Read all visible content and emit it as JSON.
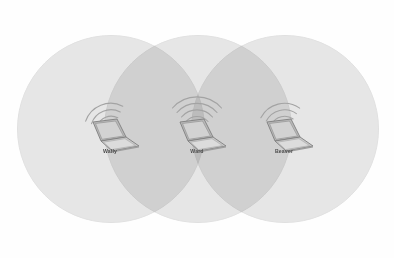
{
  "diagram": {
    "background_color": "#fefefe",
    "circle_fill": "#d9d9d9",
    "circle_stroke": "#cfcfcf",
    "circle_opacity": 0.62,
    "circle_diameter": 186,
    "label_color": "#4b4b4b",
    "laptop_color": "#8f8f8f",
    "arc_color": "#a8a8a8",
    "circles": [
      {
        "name": "left-coverage-area",
        "cx": 110,
        "cy": 128,
        "r": 93
      },
      {
        "name": "center-coverage-area",
        "cx": 197,
        "cy": 128,
        "r": 93
      },
      {
        "name": "right-coverage-area",
        "cx": 284,
        "cy": 128,
        "r": 93
      }
    ],
    "nodes": [
      {
        "id": "wally",
        "label": "Wally",
        "x": 110,
        "y": 128,
        "arc_tilt": -22
      },
      {
        "id": "ward",
        "label": "Ward",
        "x": 197,
        "y": 128,
        "arc_tilt": 0
      },
      {
        "id": "beaver",
        "label": "Beaver",
        "x": 284,
        "y": 128,
        "arc_tilt": -14
      }
    ]
  }
}
